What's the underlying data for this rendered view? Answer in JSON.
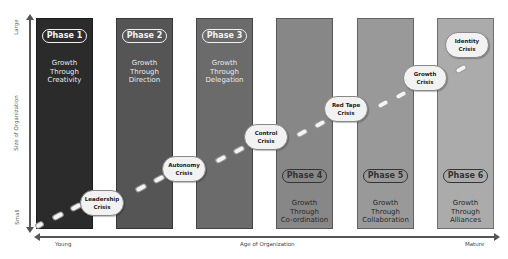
{
  "axes": {
    "y_label": "Size of Organization",
    "y_low": "Small",
    "y_high": "Large",
    "x_label": "Age of Organization",
    "x_low": "Young",
    "x_high": "Mature"
  },
  "phases": [
    {
      "label": "Phase 1",
      "growth": [
        "Growth",
        "Through",
        "Creativity"
      ],
      "color": "#2b2b2b"
    },
    {
      "label": "Phase 2",
      "growth": [
        "Growth",
        "Through",
        "Direction"
      ],
      "color": "#555555"
    },
    {
      "label": "Phase 3",
      "growth": [
        "Growth",
        "Through",
        "Delegation"
      ],
      "color": "#6b6b6b"
    },
    {
      "label": "Phase 4",
      "growth": [
        "Growth",
        "Through",
        "Co-ordination"
      ],
      "color": "#878787"
    },
    {
      "label": "Phase 5",
      "growth": [
        "Growth",
        "Through",
        "Collaboration"
      ],
      "color": "#999999"
    },
    {
      "label": "Phase 6",
      "growth": [
        "Growth",
        "Through",
        "Alliances"
      ],
      "color": "#ababab"
    }
  ],
  "crises": [
    {
      "lines": [
        "Leadership",
        "Crisis"
      ]
    },
    {
      "lines": [
        "Autonomy",
        "Crisis"
      ]
    },
    {
      "lines": [
        "Control",
        "Crisis"
      ]
    },
    {
      "lines": [
        "Red Tape",
        "Crisis"
      ]
    },
    {
      "lines": [
        "Growth",
        "Crisis"
      ]
    },
    {
      "lines": [
        "Identity",
        "Crisis"
      ]
    }
  ]
}
